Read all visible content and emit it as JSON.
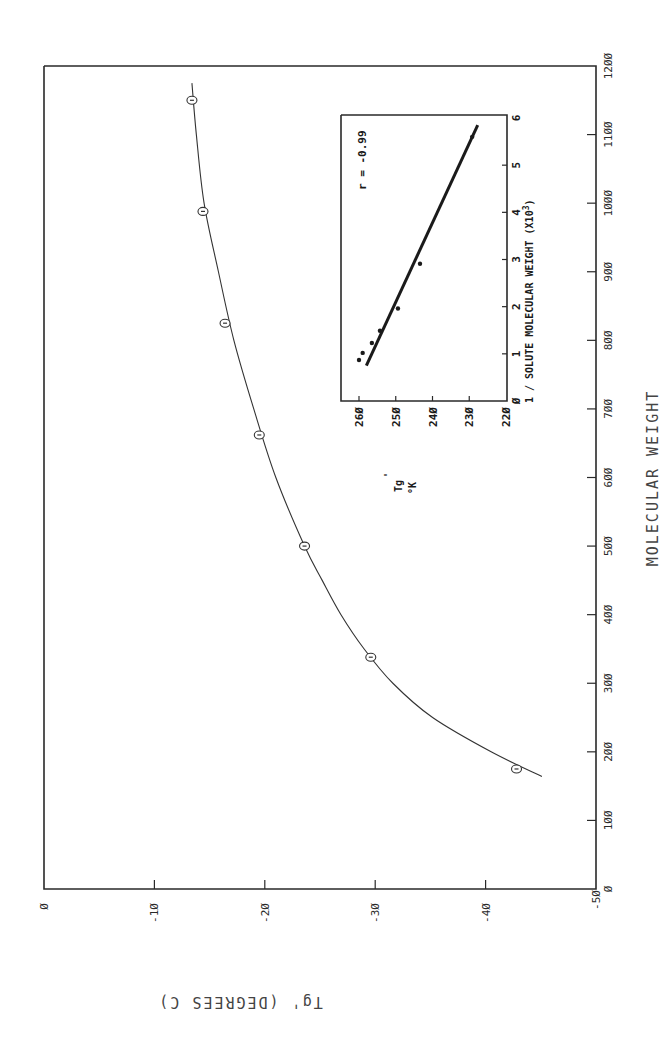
{
  "chart_data": [
    {
      "type": "scatter",
      "orientation": "rotated 90° counter-clockwise on page",
      "title": "",
      "xlabel": "MOLECULAR WEIGHT",
      "ylabel": "Tg' (DEGREES C)",
      "xlim": [
        0,
        1200
      ],
      "ylim": [
        -50,
        0
      ],
      "x_ticks": [
        "0",
        "100",
        "200",
        "300",
        "400",
        "500",
        "600",
        "700",
        "800",
        "900",
        "1000",
        "1100",
        "1200"
      ],
      "y_ticks": [
        "0",
        "-10",
        "-20",
        "-30",
        "-40",
        "-50"
      ],
      "grid": false,
      "series": [
        {
          "name": "Measured Tg'",
          "marker": "circle-dot",
          "x": [
            175,
            338,
            500,
            662,
            825,
            988,
            1150
          ],
          "y": [
            -42.8,
            -29.6,
            -23.6,
            -19.5,
            -16.4,
            -14.4,
            -13.4
          ]
        },
        {
          "name": "Fitted curve",
          "style": "line",
          "x": [
            164,
            200,
            250,
            300,
            350,
            400,
            450,
            500,
            600,
            700,
            800,
            900,
            1000,
            1100,
            1175
          ],
          "y": [
            -45.1,
            -40.5,
            -35.2,
            -31.6,
            -29.0,
            -26.9,
            -25.2,
            -23.6,
            -21.0,
            -19.0,
            -17.2,
            -15.8,
            -14.5,
            -13.8,
            -13.4
          ]
        }
      ]
    },
    {
      "type": "scatter",
      "role": "inset",
      "title": "",
      "xlabel": "1 / SOLUTE MOLECULAR WEIGHT (X10^3)",
      "ylabel": "Tg' °K",
      "xlim": [
        0,
        6
      ],
      "ylim": [
        220,
        260
      ],
      "x_ticks": [
        "0",
        "1",
        "2",
        "3",
        "4",
        "5",
        "6"
      ],
      "y_ticks": [
        "260",
        "250",
        "240",
        "230",
        "220"
      ],
      "annotation": "r = -0.99",
      "series": [
        {
          "name": "Data",
          "marker": "dot",
          "x": [
            0.87,
            1.02,
            1.23,
            1.49,
            1.96,
            2.91,
            5.6
          ],
          "y": [
            260.0,
            259.0,
            256.5,
            254.3,
            249.4,
            243.4,
            229.2
          ]
        },
        {
          "name": "Linear fit",
          "style": "line",
          "x": [
            0.75,
            5.85
          ],
          "y": [
            258.0,
            227.7
          ]
        }
      ]
    }
  ],
  "labels": {
    "main_x_title": "MOLECULAR WEIGHT",
    "main_y_title": "Tg'  (DEGREES  C)",
    "inset_x_title": "1 / SOLUTE MOLECULAR WEIGHT  (X10",
    "inset_x_title_sup": "3",
    "inset_x_title_close": ")",
    "inset_y_title_main": "Tg",
    "inset_y_title_prime": "'",
    "inset_y_title_unit": "°K",
    "correlation": "r = -0.99"
  }
}
